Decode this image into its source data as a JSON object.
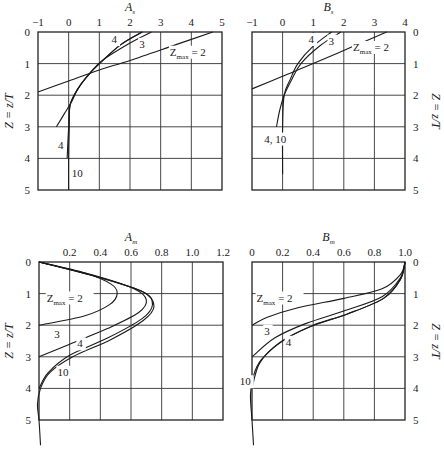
{
  "chart_data": [
    {
      "id": "As",
      "type": "line",
      "title": "A_s",
      "title_main": "A",
      "title_sub": "s",
      "xlabel": "A_s",
      "ylabel": "Z = z/T",
      "xlim": [
        -1,
        5
      ],
      "ylim": [
        0,
        5
      ],
      "y_inverted": true,
      "x_ticks": [
        "−1",
        "0",
        "1",
        "2",
        "3",
        "4",
        "5"
      ],
      "y_ticks": [
        "0",
        "1",
        "2",
        "3",
        "4",
        "5"
      ],
      "grid": true,
      "series": [
        {
          "name": "Zmax = 2",
          "points": [
            [
              4.7,
              0
            ],
            [
              3.5,
              0.4
            ],
            [
              2.0,
              0.9
            ],
            [
              1.0,
              1.2
            ],
            [
              0,
              1.55
            ],
            [
              -1,
              1.9
            ]
          ]
        },
        {
          "name": "Zmax = 3",
          "points": [
            [
              2.7,
              0
            ],
            [
              2.0,
              0.35
            ],
            [
              1.1,
              0.9
            ],
            [
              0.7,
              1.3
            ],
            [
              0.3,
              1.8
            ],
            [
              0.1,
              2.2
            ],
            [
              -0.15,
              2.6
            ],
            [
              -0.4,
              3.0
            ]
          ]
        },
        {
          "name": "Zmax = 4",
          "points": [
            [
              2.4,
              0
            ],
            [
              1.7,
              0.4
            ],
            [
              1.0,
              1.0
            ],
            [
              0.6,
              1.4
            ],
            [
              0.3,
              1.8
            ],
            [
              0.05,
              2.3
            ],
            [
              0,
              3.0
            ],
            [
              -0.05,
              4.0
            ]
          ]
        },
        {
          "name": "Zmax = 10",
          "points": [
            [
              2.4,
              0
            ],
            [
              1.7,
              0.4
            ],
            [
              1.0,
              1.0
            ],
            [
              0.6,
              1.4
            ],
            [
              0.3,
              1.8
            ],
            [
              0.05,
              2.3
            ],
            [
              0.02,
              3.0
            ],
            [
              0,
              4.0
            ],
            [
              0,
              5.0
            ]
          ]
        }
      ],
      "annotations": [
        {
          "text": "4",
          "x": 1.4,
          "y": 0.35
        },
        {
          "text": "3",
          "x": 2.3,
          "y": 0.5
        },
        {
          "text": "Zmax = 2",
          "x": 3.3,
          "y": 0.75
        },
        {
          "text": "4",
          "x": -0.35,
          "y": 3.7
        },
        {
          "text": "10",
          "x": 0.1,
          "y": 4.6
        }
      ]
    },
    {
      "id": "Bs",
      "type": "line",
      "title": "B_s",
      "title_main": "B",
      "title_sub": "s",
      "xlabel": "B_s",
      "ylabel": "Z = z/T",
      "xlim": [
        -1,
        4
      ],
      "ylim": [
        0,
        5
      ],
      "y_inverted": true,
      "x_ticks": [
        "−1",
        "0",
        "1",
        "2",
        "3",
        "4"
      ],
      "y_ticks": [
        "0",
        "1",
        "2",
        "3",
        "4",
        "5"
      ],
      "grid": true,
      "series": [
        {
          "name": "Zmax = 2",
          "points": [
            [
              3.4,
              0
            ],
            [
              2.2,
              0.5
            ],
            [
              1.0,
              1.0
            ],
            [
              0,
              1.4
            ],
            [
              -1,
              1.8
            ]
          ]
        },
        {
          "name": "Zmax = 3",
          "points": [
            [
              1.9,
              0
            ],
            [
              1.2,
              0.45
            ],
            [
              0.6,
              1.0
            ],
            [
              0.3,
              1.5
            ],
            [
              0.05,
              2.0
            ],
            [
              -0.1,
              2.5
            ],
            [
              -0.2,
              3.0
            ]
          ]
        },
        {
          "name": "Zmax = 4, 10",
          "points": [
            [
              1.6,
              0
            ],
            [
              1.0,
              0.45
            ],
            [
              0.5,
              1.0
            ],
            [
              0.25,
              1.5
            ],
            [
              0.05,
              2.0
            ],
            [
              0,
              3.0
            ],
            [
              0,
              4.5
            ]
          ]
        }
      ],
      "annotations": [
        {
          "text": "4",
          "x": 0.85,
          "y": 0.35
        },
        {
          "text": "3",
          "x": 1.5,
          "y": 0.4
        },
        {
          "text": "Zmax = 2",
          "x": 2.3,
          "y": 0.6
        },
        {
          "text": "4, 10",
          "x": -0.6,
          "y": 3.5
        }
      ]
    },
    {
      "id": "Am",
      "type": "line",
      "title": "A_m",
      "title_main": "A",
      "title_sub": "m",
      "xlabel": "A_m",
      "ylabel": "Z = z/T",
      "xlim": [
        0,
        1.2
      ],
      "ylim": [
        0,
        5
      ],
      "y_inverted": true,
      "x_ticks": [
        "",
        "0.2",
        "0.4",
        "0.6",
        "0.8",
        "1.0",
        "1.2"
      ],
      "y_ticks": [
        "0",
        "1",
        "2",
        "3",
        "4",
        "5"
      ],
      "grid": true,
      "series": [
        {
          "name": "Zmax = 2",
          "points": [
            [
              0,
              0
            ],
            [
              0.3,
              0.35
            ],
            [
              0.47,
              0.7
            ],
            [
              0.51,
              1.0
            ],
            [
              0.46,
              1.35
            ],
            [
              0.3,
              1.7
            ],
            [
              0,
              2.0
            ]
          ]
        },
        {
          "name": "Zmax = 3",
          "points": [
            [
              0,
              0
            ],
            [
              0.38,
              0.45
            ],
            [
              0.62,
              0.85
            ],
            [
              0.7,
              1.2
            ],
            [
              0.65,
              1.6
            ],
            [
              0.45,
              2.1
            ],
            [
              0.2,
              2.6
            ],
            [
              0,
              3.0
            ]
          ]
        },
        {
          "name": "Zmax = 4",
          "points": [
            [
              0,
              0
            ],
            [
              0.4,
              0.5
            ],
            [
              0.68,
              0.95
            ],
            [
              0.74,
              1.35
            ],
            [
              0.67,
              1.8
            ],
            [
              0.45,
              2.4
            ],
            [
              0.2,
              2.95
            ],
            [
              0.06,
              3.5
            ],
            [
              0,
              4.0
            ]
          ]
        },
        {
          "name": "Zmax = 10",
          "points": [
            [
              0,
              0
            ],
            [
              0.4,
              0.5
            ],
            [
              0.68,
              0.95
            ],
            [
              0.75,
              1.4
            ],
            [
              0.68,
              1.85
            ],
            [
              0.47,
              2.45
            ],
            [
              0.22,
              3.0
            ],
            [
              0.07,
              3.5
            ],
            [
              0.01,
              4.0
            ],
            [
              -0.01,
              4.5
            ],
            [
              0,
              5.0
            ],
            [
              0.01,
              5.8
            ]
          ]
        }
      ],
      "annotations": [
        {
          "text": "Zmax = 2",
          "x": 0.05,
          "y": 1.25
        },
        {
          "text": "3",
          "x": 0.1,
          "y": 2.4
        },
        {
          "text": "4",
          "x": 0.25,
          "y": 2.7
        },
        {
          "text": "10",
          "x": 0.12,
          "y": 3.6
        }
      ]
    },
    {
      "id": "Bm",
      "type": "line",
      "title": "B_m",
      "title_main": "B",
      "title_sub": "m",
      "xlabel": "B_m",
      "ylabel": "Z = z/T",
      "xlim": [
        0,
        1.0
      ],
      "ylim": [
        0,
        5
      ],
      "y_inverted": true,
      "x_ticks": [
        "0",
        "0.2",
        "0.4",
        "0.6",
        "0.8",
        "1.0"
      ],
      "y_ticks": [
        "0",
        "1",
        "2",
        "3",
        "4",
        "5"
      ],
      "grid": true,
      "series": [
        {
          "name": "Zmax = 2",
          "points": [
            [
              1.0,
              0
            ],
            [
              0.97,
              0.4
            ],
            [
              0.85,
              0.85
            ],
            [
              0.6,
              1.15
            ],
            [
              0.3,
              1.45
            ],
            [
              0.1,
              1.75
            ],
            [
              0,
              2.0
            ]
          ]
        },
        {
          "name": "Zmax = 3",
          "points": [
            [
              1.0,
              0
            ],
            [
              0.97,
              0.5
            ],
            [
              0.85,
              1.1
            ],
            [
              0.6,
              1.55
            ],
            [
              0.35,
              1.95
            ],
            [
              0.15,
              2.4
            ],
            [
              0,
              3.0
            ]
          ]
        },
        {
          "name": "Zmax = 4",
          "points": [
            [
              1.0,
              0
            ],
            [
              0.97,
              0.55
            ],
            [
              0.86,
              1.15
            ],
            [
              0.62,
              1.65
            ],
            [
              0.38,
              2.05
            ],
            [
              0.18,
              2.55
            ],
            [
              0.05,
              3.2
            ],
            [
              0,
              4.0
            ]
          ]
        },
        {
          "name": "Zmax = 10",
          "points": [
            [
              1.0,
              0
            ],
            [
              0.97,
              0.55
            ],
            [
              0.86,
              1.15
            ],
            [
              0.62,
              1.65
            ],
            [
              0.4,
              2.0
            ],
            [
              0.2,
              2.5
            ],
            [
              0.06,
              3.1
            ],
            [
              0.01,
              3.6
            ],
            [
              -0.01,
              4.2
            ],
            [
              0,
              5.0
            ],
            [
              0.01,
              5.8
            ]
          ]
        }
      ],
      "annotations": [
        {
          "text": "Zmax = 2",
          "x": 0.03,
          "y": 1.25
        },
        {
          "text": "3",
          "x": 0.08,
          "y": 2.3
        },
        {
          "text": "4",
          "x": 0.22,
          "y": 2.65
        },
        {
          "text": "10",
          "x": -0.08,
          "y": 3.9
        }
      ]
    }
  ]
}
